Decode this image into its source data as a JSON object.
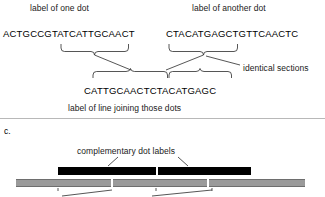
{
  "figure": {
    "panels": [
      {
        "id": "panel-b",
        "labels": {
          "left_dot_label": "label of one dot",
          "right_dot_label": "label of another dot",
          "identical_sections": "identical sections",
          "line_label": "label of line joining those dots"
        },
        "sequences": {
          "left_dot": "ACTGCCGTATCATTGCAACT",
          "right_dot": "CTACATGAGCTGTTCAACTC",
          "joining_line": "CATTGCAACTCTACATGAGC"
        }
      },
      {
        "id": "panel-c",
        "letter": "c.",
        "labels": {
          "complementary_dot_labels": "complementary dot labels"
        },
        "black_bars": [
          {
            "name": "complementary-dot-label-left",
            "x": 58,
            "width": 98
          },
          {
            "name": "complementary-dot-label-right",
            "x": 158,
            "width": 93
          }
        ],
        "gray_bars": [
          {
            "name": "genome-segment-1",
            "x": 16,
            "width": 95
          },
          {
            "name": "genome-segment-2",
            "x": 113,
            "width": 94
          },
          {
            "name": "genome-segment-3",
            "x": 209,
            "width": 96
          }
        ]
      }
    ],
    "colors": {
      "black_bar": "#000000",
      "gray_bar": "#9a9a9a",
      "gray_bar_edge": "#6e6e6e",
      "line": "#2b2b2b",
      "text": "#1a1a1a",
      "background": "#ffffff"
    }
  }
}
